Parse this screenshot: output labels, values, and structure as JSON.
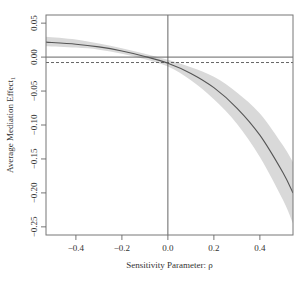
{
  "chart_data": {
    "type": "line",
    "title": "",
    "xlabel": "Sensitivity Parameter: ρ",
    "ylabel": "Average Mediation Effect",
    "ylabel_subscript": "1",
    "xlim": [
      -0.53,
      0.544
    ],
    "ylim": [
      -0.262,
      0.062
    ],
    "x_ticks": [
      -0.4,
      -0.2,
      0.0,
      0.2,
      0.4
    ],
    "x_tick_labels": [
      "−0.4",
      "−0.2",
      "0.0",
      "0.2",
      "0.4"
    ],
    "y_ticks": [
      0.05,
      0.0,
      -0.05,
      -0.1,
      -0.15,
      -0.2,
      -0.25
    ],
    "y_tick_labels": [
      "0.05",
      "0.00",
      "−0.05",
      "−0.10",
      "−0.15",
      "−0.20",
      "−0.25"
    ],
    "grid": false,
    "legend": null,
    "series": [
      {
        "name": "Average Mediation Effect estimate",
        "style": "solid",
        "color": "#555555",
        "x": [
          -0.53,
          -0.4,
          -0.3,
          -0.2,
          -0.1,
          0.0,
          0.1,
          0.2,
          0.3,
          0.4,
          0.5,
          0.544
        ],
        "values": [
          0.022,
          0.019,
          0.015,
          0.009,
          0.001,
          -0.009,
          -0.024,
          -0.045,
          -0.075,
          -0.115,
          -0.17,
          -0.2
        ]
      }
    ],
    "confidence_band": {
      "color": "#d9d9d9",
      "x": [
        -0.53,
        -0.4,
        -0.3,
        -0.2,
        -0.1,
        0.0,
        0.1,
        0.2,
        0.3,
        0.4,
        0.5,
        0.544
      ],
      "lower": [
        0.016,
        0.014,
        0.011,
        0.005,
        -0.003,
        -0.014,
        -0.034,
        -0.062,
        -0.098,
        -0.147,
        -0.21,
        -0.245
      ],
      "upper": [
        0.03,
        0.026,
        0.02,
        0.013,
        0.005,
        -0.004,
        -0.015,
        -0.029,
        -0.052,
        -0.083,
        -0.13,
        -0.155
      ]
    },
    "reference_lines": [
      {
        "orientation": "horizontal",
        "value": 0.0,
        "style": "solid",
        "color": "#555555"
      },
      {
        "orientation": "horizontal",
        "value": -0.008,
        "style": "dashed",
        "color": "#555555"
      },
      {
        "orientation": "vertical",
        "value": 0.0,
        "style": "solid",
        "color": "#555555"
      }
    ]
  },
  "axes": {
    "x_title": "Sensitivity Parameter: ρ",
    "y_title": "Average Mediation Effect",
    "y_title_sub": "1"
  }
}
